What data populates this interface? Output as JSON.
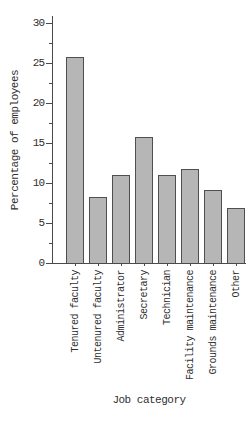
{
  "chart_data": {
    "type": "bar",
    "title": "",
    "xlabel": "Job category",
    "ylabel": "Percentage of employees",
    "categories": [
      "Tenured faculty",
      "Untenured faculty",
      "Administrator",
      "Secretary",
      "Technician",
      "Facility maintenance",
      "Grounds maintenance",
      "Other"
    ],
    "values": [
      25.7,
      8.2,
      11.0,
      15.7,
      11.0,
      11.8,
      9.1,
      6.9
    ],
    "ylim": [
      0,
      30
    ],
    "yticks_major": [
      0,
      5,
      10,
      15,
      20,
      25,
      30
    ],
    "yticks_minor": [
      2.5,
      7.5,
      12.5,
      17.5,
      22.5,
      27.5
    ],
    "grid": false,
    "legend": "none",
    "bar_fill": "#b6b6b6",
    "bar_border": "#4f4f4f",
    "axis_color": "#4a4a4a",
    "text_color": "#2f2f2f",
    "background": "#ffffff"
  }
}
